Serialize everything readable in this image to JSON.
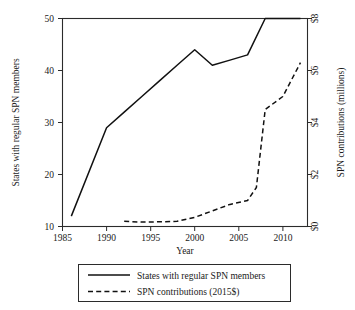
{
  "chart_data": {
    "type": "line",
    "title": "",
    "subtitle": "",
    "xlabel": "Year",
    "ylabel": "States with regular SPN members",
    "y2label": "SPN contributions (millions)",
    "xlim": [
      1985,
      2012.8
    ],
    "ylim": [
      10,
      50
    ],
    "y2lim": [
      0,
      8
    ],
    "grid": false,
    "legend_position": "bottom",
    "xticks": [
      1985,
      1990,
      1995,
      2000,
      2005,
      2010
    ],
    "xticklabels": [
      "1985",
      "1990",
      "1995",
      "2000",
      "2005",
      "2010"
    ],
    "yticks": [
      10,
      20,
      30,
      40,
      50
    ],
    "yticklabels": [
      "10",
      "20",
      "30",
      "40",
      "50"
    ],
    "y2ticks": [
      0,
      2,
      4,
      6,
      8
    ],
    "y2ticklabels": [
      "$0",
      "$2",
      "$4",
      "$6",
      "$8"
    ],
    "series": [
      {
        "name": "States with regular SPN members",
        "axis": "left",
        "style": "solid",
        "color": "#111111",
        "x": [
          1986,
          1990,
          1992,
          1994,
          1996,
          1998,
          2000,
          2002,
          2004,
          2006,
          2008,
          2010,
          2012
        ],
        "values": [
          12,
          29,
          32,
          35,
          38,
          41,
          44,
          41,
          42,
          43,
          50,
          50,
          50
        ]
      },
      {
        "name": "SPN contributions (2015$)",
        "axis": "right",
        "style": "dashed",
        "color": "#111111",
        "x": [
          1992,
          1994,
          1996,
          1998,
          2000,
          2002,
          2004,
          2006,
          2007,
          2008,
          2010,
          2012
        ],
        "values": [
          0.2,
          0.17,
          0.18,
          0.2,
          0.35,
          0.6,
          0.85,
          1.0,
          1.5,
          4.5,
          5.0,
          6.3
        ]
      }
    ]
  },
  "legend": {
    "entries": [
      {
        "label": "States with regular SPN members",
        "style": "solid"
      },
      {
        "label": "SPN contributions (2015$)",
        "style": "dashed"
      }
    ]
  }
}
